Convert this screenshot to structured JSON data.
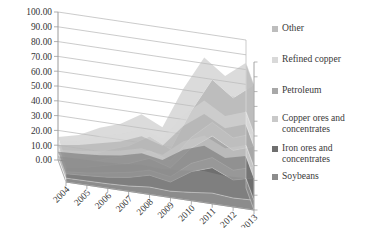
{
  "chart_data": {
    "type": "area",
    "stacked": true,
    "threeD": true,
    "title": "",
    "xlabel": "",
    "ylabel": "",
    "ylim": [
      0,
      100
    ],
    "ytick_step": 10,
    "grid": true,
    "legend_position": "right",
    "categories": [
      "2004",
      "2005",
      "2006",
      "2007",
      "2008",
      "2009",
      "2010",
      "2011",
      "2012",
      "2013"
    ],
    "ytick_labels": [
      "0.00",
      "10.00",
      "20.00",
      "30.00",
      "40.00",
      "50.00",
      "60.00",
      "70.00",
      "80.00",
      "90.00",
      "100.00"
    ],
    "series": [
      {
        "name": "Soybeans",
        "color": "#8c8c8c",
        "values": [
          2.6,
          2.8,
          3.0,
          3.6,
          5.0,
          4.3,
          5.6,
          7.2,
          6.0,
          6.6
        ]
      },
      {
        "name": "Iron ores and concentrates",
        "color": "#6f6f6f",
        "values": [
          3.0,
          3.6,
          4.4,
          5.8,
          8.0,
          6.2,
          14.0,
          17.2,
          12.2,
          15.0
        ]
      },
      {
        "name": "Copper ores and concentrates",
        "color": "#c9c9c9",
        "values": [
          1.3,
          1.8,
          3.0,
          3.4,
          3.4,
          3.6,
          5.6,
          6.8,
          6.6,
          7.4
        ]
      },
      {
        "name": "Petroleum",
        "color": "#a8a8a8",
        "values": [
          3.2,
          4.0,
          5.2,
          6.0,
          8.0,
          6.0,
          10.4,
          14.6,
          13.4,
          14.0
        ]
      },
      {
        "name": "Refined copper",
        "color": "#d9d9d9",
        "values": [
          2.0,
          2.6,
          4.6,
          5.0,
          5.0,
          4.6,
          7.2,
          9.2,
          8.4,
          8.6
        ]
      },
      {
        "name": "Other",
        "color": "#bdbdbd",
        "values": [
          3.4,
          4.2,
          5.8,
          7.0,
          10.0,
          8.0,
          18.0,
          29.0,
          27.0,
          33.0
        ]
      }
    ],
    "legend_entries": [
      "Other",
      "Refined copper",
      "Petroleum",
      "Copper ores and concentrates",
      "Iron ores and concentrates",
      "Soybeans"
    ],
    "legend_colors": [
      "#bdbdbd",
      "#d9d9d9",
      "#a8a8a8",
      "#c9c9c9",
      "#6f6f6f",
      "#8c8c8c"
    ],
    "axis_color": "#9a9a9a",
    "grid_color": "#b5b5b5",
    "wall_color": "#ffffff"
  }
}
